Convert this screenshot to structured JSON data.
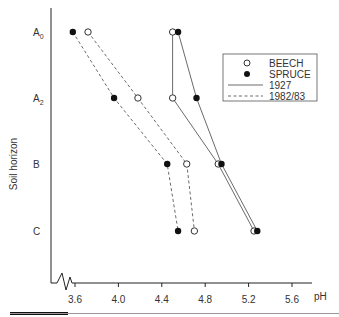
{
  "chart_data": {
    "type": "line",
    "title": "",
    "xlabel": "pH",
    "ylabel": "Soil horizon",
    "x_ticks": [
      "3.6",
      "4.0",
      "4.4",
      "4.8",
      "5.2",
      "5.6"
    ],
    "y_categories": [
      "A0",
      "A2",
      "B",
      "C"
    ],
    "y_category_labels": [
      {
        "base": "A",
        "sub": "0"
      },
      {
        "base": "A",
        "sub": "2"
      },
      {
        "base": "B",
        "sub": ""
      },
      {
        "base": "C",
        "sub": ""
      }
    ],
    "xlim": [
      3.6,
      5.8
    ],
    "axis_break": true,
    "grid": false,
    "legend_position": "upper right",
    "legend": [
      {
        "label": "BEECH",
        "marker": "open-circle"
      },
      {
        "label": "SPRUCE",
        "marker": "filled-circle"
      },
      {
        "label": "1927",
        "line": "solid"
      },
      {
        "label": "1982/83",
        "line": "dashed"
      }
    ],
    "series": [
      {
        "name": "BEECH 1927",
        "marker": "open",
        "line": "solid",
        "values": [
          4.5,
          4.5,
          4.92,
          5.25
        ]
      },
      {
        "name": "SPRUCE 1927",
        "marker": "filled",
        "line": "solid",
        "values": [
          4.55,
          4.72,
          4.95,
          5.28
        ]
      },
      {
        "name": "BEECH 1982/83",
        "marker": "open",
        "line": "dashed",
        "values": [
          3.72,
          4.18,
          4.63,
          4.7
        ]
      },
      {
        "name": "SPRUCE 1982/83",
        "marker": "filled",
        "line": "dashed",
        "values": [
          3.58,
          3.96,
          4.45,
          4.55
        ]
      }
    ]
  },
  "labels": {
    "ylabel": "Soil horizon",
    "xlabel": "pH",
    "legend_beech": "BEECH",
    "legend_spruce": "SPRUCE",
    "legend_1927": "1927",
    "legend_1982": "1982/83"
  }
}
